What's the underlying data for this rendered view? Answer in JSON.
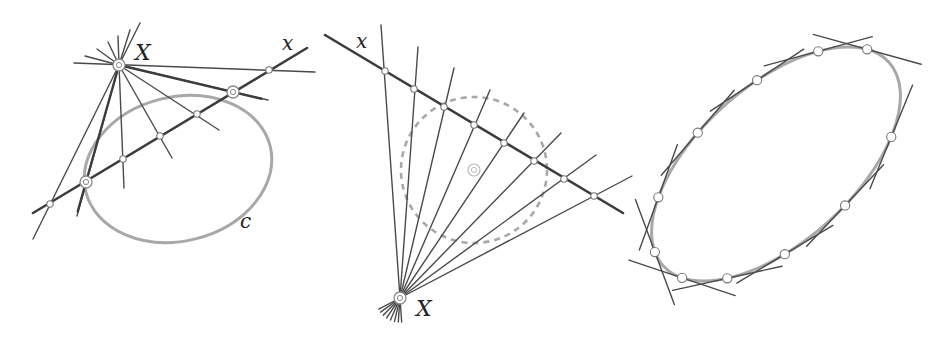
{
  "figure": {
    "colors": {
      "line": "#4a4a4a",
      "thick_line": "#3c3c3c",
      "conic": "#a8a8a8",
      "point_fill": "#ffffff",
      "point_stroke": "#777777",
      "background": "#ffffff"
    }
  },
  "panels": [
    {
      "id": "left",
      "labels": {
        "pole": "X",
        "polar": "x",
        "conic": "c"
      },
      "pole": [
        119,
        65
      ],
      "polar_line": [
        [
          33,
          213
        ],
        [
          307,
          48
        ]
      ],
      "horizontal_line": [
        [
          74,
          63
        ],
        [
          315,
          72
        ]
      ],
      "conic": {
        "cx": 178,
        "cy": 169,
        "rx": 95,
        "ry": 72,
        "rotation": -14
      },
      "tangent_points": [
        [
          86,
          182
        ],
        [
          233,
          92
        ]
      ],
      "polar_points": [
        [
          50,
          204
        ],
        [
          123,
          159
        ],
        [
          160,
          136
        ],
        [
          197,
          114
        ],
        [
          269,
          70
        ]
      ],
      "pencil_rays": [
        [
          [
            119,
            65
          ],
          [
            33,
            239
          ]
        ],
        [
          [
            119,
            65
          ],
          [
            77,
            216
          ]
        ],
        [
          [
            119,
            65
          ],
          [
            124,
            188
          ]
        ],
        [
          [
            119,
            65
          ],
          [
            172,
            158
          ]
        ],
        [
          [
            119,
            65
          ],
          [
            219,
            130
          ]
        ],
        [
          [
            119,
            65
          ],
          [
            268,
            100
          ]
        ],
        [
          [
            119,
            65
          ],
          [
            140,
            23
          ]
        ],
        [
          [
            119,
            65
          ],
          [
            130,
            30
          ]
        ],
        [
          [
            119,
            65
          ],
          [
            118,
            36
          ]
        ],
        [
          [
            119,
            65
          ],
          [
            108,
            42
          ]
        ],
        [
          [
            119,
            65
          ],
          [
            97,
            49
          ]
        ],
        [
          [
            119,
            65
          ],
          [
            85,
            56
          ]
        ]
      ],
      "label_positions": {
        "pole": [
          135,
          60
        ],
        "polar": [
          282,
          50
        ],
        "conic": [
          240,
          228
        ]
      }
    },
    {
      "id": "middle",
      "labels": {
        "pole": "X",
        "polar": "x"
      },
      "pole": [
        400,
        298
      ],
      "polar_line": [
        [
          325,
          35
        ],
        [
          623,
          213
        ]
      ],
      "circle": {
        "cx": 474,
        "cy": 170,
        "r": 73,
        "dashed": true
      },
      "circle_center_marker": [
        474,
        170
      ],
      "polar_points": [
        [
          385,
          71
        ],
        [
          414,
          89
        ],
        [
          444,
          107
        ],
        [
          474,
          125
        ],
        [
          504,
          143
        ],
        [
          534,
          161
        ],
        [
          564,
          179
        ],
        [
          594,
          196
        ]
      ],
      "ray_ends": [
        [
          381,
          25
        ],
        [
          418,
          47
        ],
        [
          454,
          68
        ],
        [
          490,
          90
        ],
        [
          524,
          113
        ],
        [
          561,
          133
        ],
        [
          596,
          155
        ],
        [
          632,
          176
        ]
      ],
      "label_positions": {
        "pole": [
          416,
          316
        ],
        "polar": [
          356,
          48
        ]
      }
    },
    {
      "id": "right",
      "conic": {
        "cx": 776,
        "cy": 164,
        "rx": 152,
        "ry": 78,
        "rotation": -42
      },
      "tangent_points": [
        [
          818,
          52
        ],
        [
          865,
          52
        ],
        [
          757,
          80
        ],
        [
          701,
          134
        ],
        [
          663,
          196
        ],
        [
          655,
          252
        ],
        [
          677,
          284
        ],
        [
          724,
          286
        ],
        [
          785,
          256
        ],
        [
          841,
          203
        ],
        [
          878,
          140
        ]
      ],
      "tangent_half_length": 40
    }
  ]
}
